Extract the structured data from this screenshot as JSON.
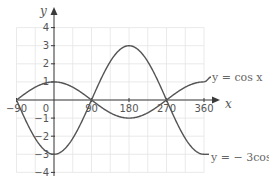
{
  "chart_data": {
    "type": "line",
    "title": "",
    "xlabel": "x",
    "ylabel": "y",
    "xlim": [
      -90,
      360
    ],
    "ylim": [
      -4,
      4
    ],
    "grid": true,
    "x_ticks": [
      -90,
      0,
      90,
      180,
      270,
      360
    ],
    "x_tick_labels": [
      "−90",
      "0",
      "90",
      "180",
      "270",
      "360"
    ],
    "y_ticks": [
      4,
      3,
      2,
      1,
      -1,
      -2,
      -3,
      -4
    ],
    "y_tick_labels": [
      "4",
      "3",
      "2",
      "1",
      "−1",
      "−2",
      "−3",
      "−4"
    ],
    "series": [
      {
        "name": "y = cos x",
        "label": "y = cos x",
        "x": [
          -90,
          -45,
          0,
          45,
          90,
          135,
          180,
          225,
          270,
          315,
          360
        ],
        "values": [
          0,
          0.71,
          1,
          0.71,
          0,
          -0.71,
          -1,
          -0.71,
          0,
          0.71,
          1
        ]
      },
      {
        "name": "y = − 3cos x",
        "label": "y = − 3cos x",
        "x": [
          -90,
          -45,
          0,
          45,
          90,
          135,
          180,
          225,
          270,
          315,
          360
        ],
        "values": [
          0,
          -2.12,
          -3,
          -2.12,
          0,
          2.12,
          3,
          2.12,
          0,
          -2.12,
          -3
        ]
      }
    ],
    "annotations": [
      "y = cos x",
      "y = − 3cos x"
    ]
  },
  "colors": {
    "curve": "#555555",
    "axis": "#3a3a3a",
    "grid": "#e4e4e4",
    "text": "#555555"
  }
}
